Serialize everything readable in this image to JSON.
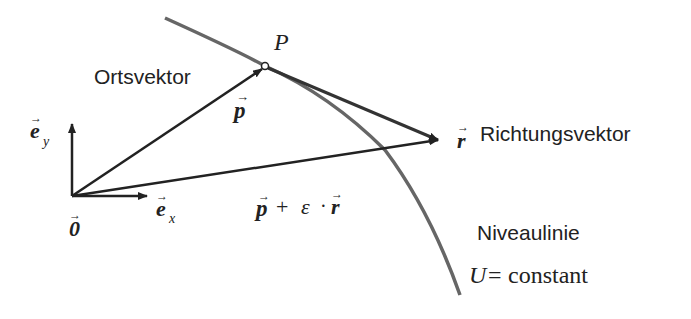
{
  "diagram": {
    "labels": {
      "ortsvektor": "Ortsvektor",
      "richtungsvektor": "Richtungsvektor",
      "niveaulinie": "Niveaulinie",
      "point_p": "P",
      "vec_p": "p",
      "vec_r": "r",
      "vec_ey_base": "e",
      "vec_ey_sub": "y",
      "vec_ex_base": "e",
      "vec_ex_sub": "x",
      "origin": "0",
      "sum_p": "p",
      "sum_plus": "+",
      "sum_eps": "ε",
      "sum_dot": "·",
      "sum_r": "r",
      "constant_var": "U",
      "constant_eq": "=",
      "constant_text": "constant",
      "vector_arrow": "⃗"
    },
    "colors": {
      "vector": "#222222",
      "curve": "#555555",
      "text": "#222222"
    }
  }
}
